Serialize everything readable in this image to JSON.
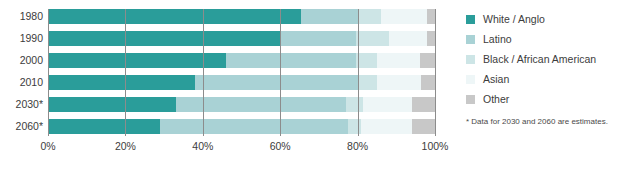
{
  "chart_data": {
    "type": "bar",
    "orientation": "horizontal",
    "stacked": true,
    "normalized_percent": true,
    "title": "",
    "xlabel": "",
    "ylabel": "",
    "xlim": [
      0,
      100
    ],
    "grid": true,
    "legend_position": "right",
    "categories": [
      "1980",
      "1990",
      "2000",
      "2010",
      "2030*",
      "2060*"
    ],
    "xticks": [
      0,
      20,
      40,
      60,
      80,
      100
    ],
    "xtick_labels": [
      "0%",
      "20%",
      "40%",
      "60%",
      "80%",
      "100%"
    ],
    "series": [
      {
        "name": "White / Anglo",
        "color": "#2a9d9a",
        "values": [
          65.5,
          60.0,
          46.0,
          38.0,
          33.0,
          29.0
        ]
      },
      {
        "name": "Latino",
        "color": "#a9d2d5",
        "values": [
          14.5,
          19.5,
          33.5,
          42.0,
          44.0,
          48.5
        ]
      },
      {
        "name": "Black / African American",
        "color": "#cde5e6",
        "values": [
          6.0,
          8.5,
          5.5,
          5.0,
          4.5,
          3.5
        ]
      },
      {
        "name": "Asian",
        "color": "#eef6f7",
        "values": [
          12.0,
          10.0,
          11.0,
          11.5,
          12.5,
          13.0
        ]
      },
      {
        "name": "Other",
        "color": "#c8c8c8",
        "values": [
          2.0,
          2.0,
          4.0,
          3.5,
          6.0,
          6.0
        ]
      }
    ],
    "annotations": [
      "* Data for 2030 and 2060 are estimates."
    ]
  },
  "legend": {
    "items": [
      {
        "label": "White / Anglo",
        "color": "#2a9d9a"
      },
      {
        "label": "Latino",
        "color": "#a9d2d5"
      },
      {
        "label": "Black / African American",
        "color": "#cde5e6"
      },
      {
        "label": "Asian",
        "color": "#eef6f7"
      },
      {
        "label": "Other",
        "color": "#c8c8c8"
      }
    ]
  },
  "footnote": "* Data for 2030 and 2060 are estimates."
}
